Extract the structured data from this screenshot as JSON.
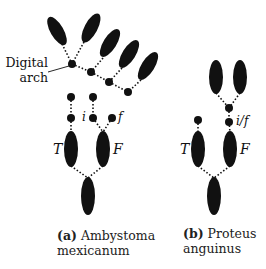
{
  "diagram": {
    "annotation": {
      "line1": "Digital",
      "line2": "arch"
    },
    "panel_a": {
      "labels": {
        "i": "i",
        "f": "f",
        "T": "T",
        "F": "F"
      },
      "caption": {
        "tag": "(a)",
        "line1": "Ambystoma",
        "line2": "mexicanum"
      }
    },
    "panel_b": {
      "labels": {
        "if": "i/f",
        "T": "T",
        "F": "F"
      },
      "caption": {
        "tag": "(b)",
        "line1": "Proteus",
        "line2": "anguinus"
      }
    },
    "colors": {
      "ink": "#111111",
      "background": "#ffffff"
    }
  }
}
